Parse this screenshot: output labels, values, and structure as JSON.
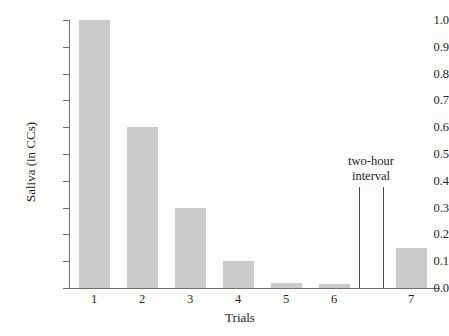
{
  "chart_data": {
    "type": "bar",
    "title": "",
    "xlabel": "Trials",
    "ylabel": "Saliva (in CCs)",
    "categories": [
      "1",
      "2",
      "3",
      "4",
      "5",
      "6",
      "7"
    ],
    "values": [
      1.0,
      0.6,
      0.3,
      0.1,
      0.02,
      0.015,
      0.15
    ],
    "ylim": [
      0.0,
      1.0
    ],
    "ytick_labels": [
      "0.0",
      "0.1",
      "0.2",
      "0.3",
      "0.4",
      "0.5",
      "0.6",
      "0.7",
      "0.8",
      "0.9",
      "1.0"
    ],
    "ytick_values": [
      0.0,
      0.1,
      0.2,
      0.3,
      0.4,
      0.5,
      0.6,
      0.7,
      0.8,
      0.9,
      1.0
    ],
    "grid": false,
    "legend": false,
    "bar_color": "#cbcbcb",
    "axis_color": "#6f6f6f",
    "annotations": [
      {
        "name": "two-hour-interval",
        "line1": "two-hour",
        "line2": "interval",
        "after_category": "6"
      }
    ]
  },
  "axis": {
    "ylabel": "Saliva (in CCs)",
    "xlabel": "Trials"
  }
}
